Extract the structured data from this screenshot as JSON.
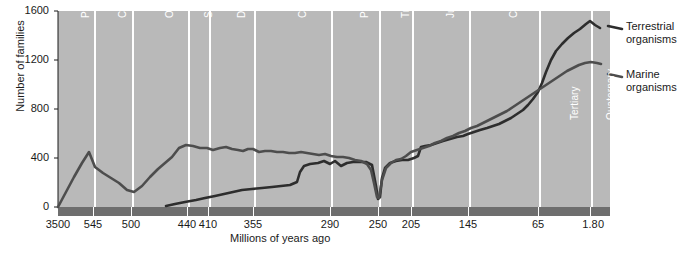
{
  "chart_data": {
    "type": "line",
    "title": "",
    "xlabel": "Millions of years ago",
    "ylabel": "Number of families",
    "xlim": [
      0,
      100
    ],
    "ylim": [
      0,
      1600
    ],
    "grid": false,
    "legend_position": "right",
    "x_axis_note": "Non-linear geological time axis, oldest (3500 Ma) at left, present (0) at right",
    "xtick_labels": [
      "3500",
      "545",
      "500",
      "440",
      "410",
      "355",
      "290",
      "250",
      "205",
      "145",
      "65",
      "1.8",
      "0"
    ],
    "xtick_positions_px": [
      58,
      93,
      131,
      187,
      208,
      253,
      330,
      378,
      411,
      468,
      538,
      590,
      601
    ],
    "ytick_labels": [
      "0",
      "400",
      "800",
      "1200",
      "1600"
    ],
    "ytick_values": [
      0,
      400,
      800,
      1200,
      1600
    ],
    "periods": [
      {
        "label": "Pre-cambrian",
        "start_ma": 3500,
        "end_ma": 545,
        "x0_px": 58,
        "x1_px": 93
      },
      {
        "label": "Cambrian",
        "start_ma": 545,
        "end_ma": 500,
        "x0_px": 95,
        "x1_px": 131
      },
      {
        "label": "Ordovician",
        "start_ma": 500,
        "end_ma": 440,
        "x0_px": 133,
        "x1_px": 187
      },
      {
        "label": "Silurian",
        "start_ma": 440,
        "end_ma": 410,
        "x0_px": 189,
        "x1_px": 208
      },
      {
        "label": "Devonian",
        "start_ma": 410,
        "end_ma": 355,
        "x0_px": 210,
        "x1_px": 253
      },
      {
        "label": "Carboniferous",
        "start_ma": 355,
        "end_ma": 290,
        "x0_px": 255,
        "x1_px": 330
      },
      {
        "label": "Permian",
        "start_ma": 290,
        "end_ma": 250,
        "x0_px": 332,
        "x1_px": 378
      },
      {
        "label": "Triassic",
        "start_ma": 250,
        "end_ma": 205,
        "x0_px": 380,
        "x1_px": 411
      },
      {
        "label": "Jurassic",
        "start_ma": 205,
        "end_ma": 145,
        "x0_px": 413,
        "x1_px": 468
      },
      {
        "label": "Cretaceous",
        "start_ma": 145,
        "end_ma": 65,
        "x0_px": 470,
        "x1_px": 538
      },
      {
        "label": "Tertiary",
        "start_ma": 65,
        "end_ma": 1.8,
        "x0_px": 540,
        "x1_px": 590
      },
      {
        "label": "Quaternary",
        "start_ma": 1.8,
        "end_ma": 0,
        "x0_px": 592,
        "x1_px": 610
      }
    ],
    "series": [
      {
        "name": "Terrestrial organisms",
        "color": "#2d2d2d",
        "points_px": [
          [
            166,
            206
          ],
          [
            175,
            204
          ],
          [
            185,
            202
          ],
          [
            196,
            200
          ],
          [
            205,
            198
          ],
          [
            215,
            196
          ],
          [
            224,
            194
          ],
          [
            233,
            192
          ],
          [
            242,
            190
          ],
          [
            252,
            189
          ],
          [
            262,
            188
          ],
          [
            272,
            187
          ],
          [
            281,
            186
          ],
          [
            290,
            185
          ],
          [
            297,
            182
          ],
          [
            300,
            172
          ],
          [
            304,
            166
          ],
          [
            310,
            164
          ],
          [
            318,
            163
          ],
          [
            324,
            161
          ],
          [
            330,
            164
          ],
          [
            335,
            161
          ],
          [
            341,
            166
          ],
          [
            347,
            163
          ],
          [
            353,
            162
          ],
          [
            360,
            162
          ],
          [
            366,
            162
          ],
          [
            372,
            165
          ],
          [
            376,
            186
          ],
          [
            378,
            199
          ],
          [
            380,
            197
          ],
          [
            382,
            178
          ],
          [
            385,
            168
          ],
          [
            390,
            163
          ],
          [
            396,
            161
          ],
          [
            402,
            160
          ],
          [
            408,
            160
          ],
          [
            411,
            159
          ],
          [
            414,
            158
          ],
          [
            418,
            156
          ],
          [
            421,
            147
          ],
          [
            425,
            146
          ],
          [
            431,
            145
          ],
          [
            437,
            143
          ],
          [
            443,
            141
          ],
          [
            450,
            139
          ],
          [
            457,
            137
          ],
          [
            463,
            136
          ],
          [
            468,
            134
          ],
          [
            474,
            132
          ],
          [
            480,
            130
          ],
          [
            487,
            128
          ],
          [
            493,
            126
          ],
          [
            499,
            124
          ],
          [
            505,
            121
          ],
          [
            511,
            118
          ],
          [
            517,
            114
          ],
          [
            523,
            110
          ],
          [
            528,
            105
          ],
          [
            533,
            99
          ],
          [
            538,
            92
          ],
          [
            542,
            83
          ],
          [
            546,
            72
          ],
          [
            551,
            60
          ],
          [
            556,
            51
          ],
          [
            562,
            44
          ],
          [
            568,
            38
          ],
          [
            574,
            33
          ],
          [
            580,
            29
          ],
          [
            586,
            24
          ],
          [
            590,
            21
          ],
          [
            595,
            25
          ],
          [
            600,
            28
          ]
        ],
        "value_range": "0 to ~1560 families; rises from 0 at ~430 Ma to ~1560 at present, with Permian crash at 250 Ma"
      },
      {
        "name": "Marine organisms",
        "color": "#4d4d4d",
        "points_px": [
          [
            58,
            207
          ],
          [
            66,
            192
          ],
          [
            74,
            177
          ],
          [
            82,
            163
          ],
          [
            89,
            152
          ],
          [
            95,
            167
          ],
          [
            103,
            173
          ],
          [
            111,
            178
          ],
          [
            119,
            183
          ],
          [
            127,
            190
          ],
          [
            134,
            192
          ],
          [
            142,
            186
          ],
          [
            150,
            177
          ],
          [
            158,
            169
          ],
          [
            165,
            163
          ],
          [
            172,
            157
          ],
          [
            179,
            148
          ],
          [
            186,
            145
          ],
          [
            193,
            146
          ],
          [
            200,
            148
          ],
          [
            207,
            148
          ],
          [
            213,
            150
          ],
          [
            220,
            148
          ],
          [
            226,
            147
          ],
          [
            232,
            149
          ],
          [
            238,
            150
          ],
          [
            243,
            151
          ],
          [
            248,
            149
          ],
          [
            253,
            149
          ],
          [
            259,
            152
          ],
          [
            265,
            151
          ],
          [
            271,
            151
          ],
          [
            277,
            152
          ],
          [
            283,
            152
          ],
          [
            289,
            153
          ],
          [
            295,
            153
          ],
          [
            301,
            152
          ],
          [
            307,
            153
          ],
          [
            313,
            154
          ],
          [
            319,
            155
          ],
          [
            325,
            154
          ],
          [
            331,
            156
          ],
          [
            337,
            157
          ],
          [
            343,
            157
          ],
          [
            349,
            158
          ],
          [
            355,
            160
          ],
          [
            361,
            161
          ],
          [
            367,
            164
          ],
          [
            371,
            170
          ],
          [
            374,
            183
          ],
          [
            377,
            197
          ],
          [
            379,
            198
          ],
          [
            382,
            180
          ],
          [
            386,
            168
          ],
          [
            391,
            163
          ],
          [
            396,
            160
          ],
          [
            401,
            159
          ],
          [
            406,
            156
          ],
          [
            411,
            152
          ],
          [
            417,
            150
          ],
          [
            423,
            148
          ],
          [
            429,
            146
          ],
          [
            435,
            143
          ],
          [
            441,
            141
          ],
          [
            447,
            138
          ],
          [
            453,
            136
          ],
          [
            459,
            133
          ],
          [
            465,
            131
          ],
          [
            471,
            128
          ],
          [
            477,
            126
          ],
          [
            483,
            123
          ],
          [
            489,
            120
          ],
          [
            495,
            117
          ],
          [
            501,
            114
          ],
          [
            507,
            111
          ],
          [
            513,
            107
          ],
          [
            519,
            103
          ],
          [
            525,
            99
          ],
          [
            531,
            95
          ],
          [
            537,
            91
          ],
          [
            543,
            87
          ],
          [
            549,
            83
          ],
          [
            555,
            79
          ],
          [
            561,
            75
          ],
          [
            567,
            71
          ],
          [
            573,
            68
          ],
          [
            579,
            65
          ],
          [
            585,
            63
          ],
          [
            591,
            62
          ],
          [
            597,
            63
          ],
          [
            601,
            64
          ]
        ],
        "value_range": "0 to ~1200 families; peaks ~320 in Cambrian, plateaus ~450-500, crashes at 250 Ma, rises to ~1200 at present"
      }
    ],
    "annotations": [
      {
        "text": "Permian mass extinction",
        "x_ma": 250,
        "visible": false
      }
    ]
  },
  "legend": {
    "items": [
      {
        "label_line1": "Terrestrial",
        "label_line2": "organisms",
        "color": "#2d2d2d"
      },
      {
        "label_line1": "Marine",
        "label_line2": "organisms",
        "color": "#4d4d4d"
      }
    ]
  },
  "colors": {
    "plot_background": "#b9b9b9",
    "divider": "#ffffff",
    "axis_bar": "#6e6e6e",
    "terrestrial": "#2d2d2d",
    "marine": "#4d4d4d",
    "text": "#1a1a1a",
    "period_text": "#ffffff"
  }
}
